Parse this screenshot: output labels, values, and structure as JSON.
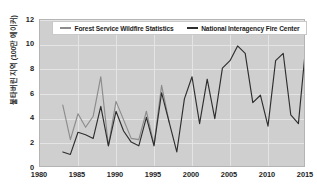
{
  "chart_data": {
    "type": "line",
    "title": "",
    "xlabel": "",
    "ylabel": "불타버린 지역 (100만 에이커)",
    "xlim": [
      1980,
      2015
    ],
    "ylim": [
      0,
      12
    ],
    "ytick_values": [
      0,
      2,
      4,
      6,
      8,
      10,
      12
    ],
    "ytick_labels": [
      "0",
      "2",
      "4",
      "6",
      "8",
      "10",
      "12"
    ],
    "xtick_values": [
      1980,
      1985,
      1990,
      1995,
      2000,
      2005,
      2010,
      2015
    ],
    "xtick_labels": [
      "1980",
      "1985",
      "1990",
      "1995",
      "2000",
      "2005",
      "2010",
      "2015"
    ],
    "grid": true,
    "legend_position": "top-center",
    "plot_background": "#cfcfcf",
    "gridline_color": "#e4e4e4",
    "series": [
      {
        "name": "Forest Service Wildfire Statistics",
        "color": "#8c8c8c",
        "x": [
          1983,
          1984,
          1985,
          1986,
          1987,
          1988,
          1989,
          1990,
          1991,
          1992,
          1993,
          1994,
          1995,
          1996,
          1997
        ],
        "values": [
          5.1,
          2.3,
          4.4,
          3.3,
          4.2,
          7.4,
          1.8,
          5.4,
          3.9,
          2.4,
          2.3,
          4.6,
          1.9,
          6.7,
          3.7
        ]
      },
      {
        "name": "National Interagency Fire Center",
        "color": "#2e2e2e",
        "x": [
          1983,
          1984,
          1985,
          1986,
          1987,
          1988,
          1989,
          1990,
          1991,
          1992,
          1993,
          1994,
          1995,
          1996,
          1997,
          1998,
          1999,
          2000,
          2001,
          2002,
          2003,
          2004,
          2005,
          2006,
          2007,
          2008,
          2009,
          2010,
          2011,
          2012,
          2013,
          2014,
          2015
        ],
        "values": [
          1.3,
          1.1,
          2.9,
          2.7,
          2.4,
          5.0,
          1.8,
          4.6,
          3.0,
          2.1,
          1.8,
          4.1,
          1.8,
          6.1,
          3.7,
          1.3,
          5.6,
          7.4,
          3.6,
          7.2,
          4.0,
          8.1,
          8.7,
          9.9,
          9.3,
          5.3,
          5.9,
          3.4,
          8.7,
          9.3,
          4.3,
          3.6,
          10.1
        ]
      }
    ]
  }
}
